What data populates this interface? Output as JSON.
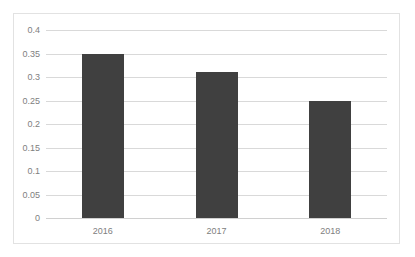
{
  "chart_data": {
    "type": "bar",
    "title": "",
    "subtitle": "",
    "xlabel": "",
    "ylabel": "",
    "categories": [
      "2016",
      "2017",
      "2018"
    ],
    "values": [
      0.35,
      0.31,
      0.25
    ],
    "ylim": [
      0,
      0.4
    ],
    "ytick_labels": [
      "0.4",
      "0.35",
      "0.3",
      "0.25",
      "0.2",
      "0.15",
      "0.1",
      "0.05",
      "0"
    ],
    "ytick_values": [
      0.4,
      0.35,
      0.3,
      0.25,
      0.2,
      0.15,
      0.1,
      0.05,
      0
    ],
    "grid": true,
    "legend": false,
    "legend_position": "none",
    "annotations": [],
    "colors": {
      "bar": "#404040",
      "gridline": "#d9d9d9",
      "axis_text": "#808080",
      "frame_border": "#e2e2e2",
      "background": "#ffffff"
    }
  }
}
